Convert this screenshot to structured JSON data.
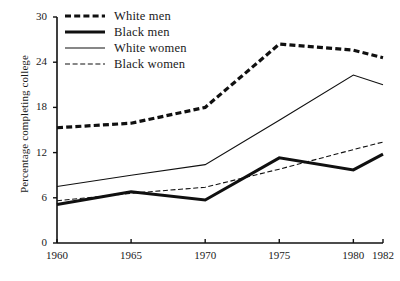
{
  "chart_data": {
    "type": "line",
    "title": "",
    "xlabel": "",
    "ylabel": "Percentage completing college",
    "x": [
      1960,
      1965,
      1970,
      1975,
      1980,
      1982
    ],
    "xtick_labels": [
      "1960",
      "1965",
      "1970",
      "1975",
      "1980",
      "1982"
    ],
    "ytick_labels": [
      "0",
      "6",
      "12",
      "18",
      "24",
      "30"
    ],
    "yticks": [
      0,
      6,
      12,
      18,
      24,
      30
    ],
    "ylim": [
      0,
      30
    ],
    "xlim": [
      1960,
      1982
    ],
    "grid": false,
    "legend_position": "top-left",
    "series": [
      {
        "name": "White men",
        "style": "thick-dashed",
        "color": "#101010",
        "values": [
          15.3,
          15.9,
          18.0,
          26.4,
          25.6,
          24.6
        ]
      },
      {
        "name": "Black men",
        "style": "thick-solid",
        "color": "#101010",
        "values": [
          5.1,
          6.8,
          5.7,
          11.3,
          9.7,
          11.8
        ]
      },
      {
        "name": "White women",
        "style": "thin-solid",
        "color": "#101010",
        "values": [
          7.5,
          9.0,
          10.4,
          16.3,
          22.3,
          21.0
        ]
      },
      {
        "name": "Black women",
        "style": "thin-dashed",
        "color": "#101010",
        "values": [
          5.6,
          6.6,
          7.4,
          9.8,
          12.4,
          13.4
        ]
      }
    ]
  },
  "axis": {
    "y_title": "Percentage completing college"
  },
  "legend": {
    "items": [
      {
        "label": "White men"
      },
      {
        "label": "Black men"
      },
      {
        "label": "White women"
      },
      {
        "label": "Black women"
      }
    ]
  },
  "colors": {
    "ink": "#101010",
    "background": "#ffffff"
  }
}
